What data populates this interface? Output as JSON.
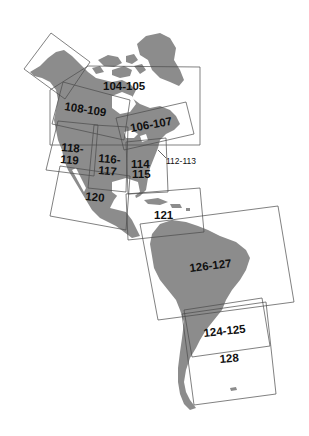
{
  "map": {
    "title": "Americas index map",
    "colors": {
      "land": "#8c8c8c",
      "background": "#ffffff",
      "box_stroke": "#4a4a4a",
      "label": "#111111"
    }
  },
  "pages": [
    {
      "id": "104-105",
      "label": "104-105"
    },
    {
      "id": "108-109",
      "label": "108-109"
    },
    {
      "id": "106-107",
      "label": "106-107"
    },
    {
      "id": "118-119",
      "label_top": "118-",
      "label_bottom": "119"
    },
    {
      "id": "116-117",
      "label_top": "116-",
      "label_bottom": "117"
    },
    {
      "id": "114-115",
      "label_top": "114",
      "label_bottom": "115"
    },
    {
      "id": "112-113",
      "label": "112-113"
    },
    {
      "id": "120",
      "label": "120"
    },
    {
      "id": "121",
      "label": "121"
    },
    {
      "id": "126-127",
      "label": "126-127"
    },
    {
      "id": "124-125",
      "label": "124-125"
    },
    {
      "id": "128",
      "label": "128"
    },
    {
      "id": "alaska",
      "label": ""
    }
  ]
}
